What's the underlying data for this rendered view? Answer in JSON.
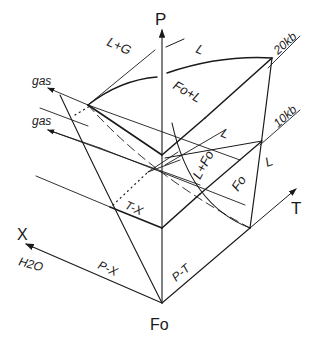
{
  "diagram": {
    "type": "P-T-X phase diagram (block projection)",
    "axes": {
      "p_axis": "P",
      "t_axis": "T",
      "x_axis": "X",
      "x_component": "H2O",
      "origin": "Fo"
    },
    "planes": {
      "px": "P-X",
      "pt": "P-T",
      "tx": "T-X"
    },
    "pressure_levels": {
      "high": "20kb",
      "low": "10kb"
    },
    "field_labels": {
      "liquid_gas": "L+G",
      "liquid_top": "L",
      "forsterite_liquid": "Fo+L",
      "liquid_mid": "L",
      "liquid_forsterite": "L+Fo",
      "forsterite": "Fo",
      "liquid_right": "L"
    },
    "gas_labels": {
      "upper": "gas",
      "lower": "gas"
    },
    "colors": {
      "line": "#1a1a1a",
      "background": "#ffffff"
    }
  }
}
